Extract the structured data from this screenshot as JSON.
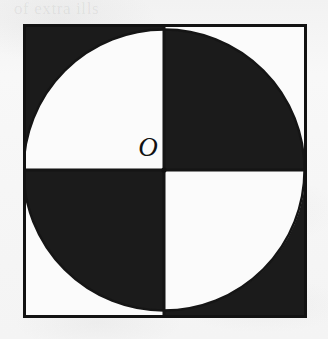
{
  "page": {
    "background_color": "#f6f6f6",
    "ghost_text": {
      "line1": "of extra ills",
      "line2": "with the",
      "line3": "area of the"
    }
  },
  "figure": {
    "name": "inscribed-circle-quadrants",
    "origin_label": "O",
    "colors": {
      "ink": "#1b1b1b",
      "paper": "#fbfbfb",
      "border": "#121212"
    },
    "square": {
      "x": 24,
      "y": 25,
      "width": 281,
      "height": 291,
      "stroke_width": 3
    },
    "circle": {
      "center_x": 164,
      "center_y": 170,
      "radius": 140
    },
    "axes": {
      "vertical_line": "x = 164",
      "horizontal_line": "y = 170",
      "stroke_width": 3
    },
    "regions": [
      {
        "id": "quadrant-1",
        "label": "upper-right inside circle",
        "fill": "#1b1b1b"
      },
      {
        "id": "quadrant-2",
        "label": "upper-left inside circle",
        "fill": "#fbfbfb"
      },
      {
        "id": "quadrant-3",
        "label": "lower-left inside circle",
        "fill": "#1b1b1b"
      },
      {
        "id": "quadrant-4",
        "label": "lower-right inside circle",
        "fill": "#fbfbfb"
      },
      {
        "id": "corner-top-left",
        "label": "top-left corner outside circle",
        "fill": "#1b1b1b"
      },
      {
        "id": "corner-top-right",
        "label": "top-right corner outside circle",
        "fill": "#fbfbfb"
      },
      {
        "id": "corner-bottom-left",
        "label": "bottom-left corner outside circle",
        "fill": "#fbfbfb"
      },
      {
        "id": "corner-bottom-right",
        "label": "bottom-right corner outside circle",
        "fill": "#1b1b1b"
      }
    ]
  }
}
